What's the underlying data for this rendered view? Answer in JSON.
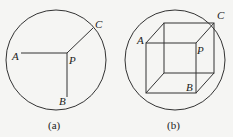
{
  "figure_a": {
    "caption": "(a)",
    "labels": {
      "A": "A",
      "B": "B",
      "C": "C",
      "P": "P"
    }
  },
  "figure_b": {
    "caption": "(b)",
    "labels": {
      "A": "A",
      "B": "B",
      "C": "C",
      "P": "P"
    }
  },
  "colors": {
    "line": "#333333",
    "background": "#f5f5f3"
  }
}
